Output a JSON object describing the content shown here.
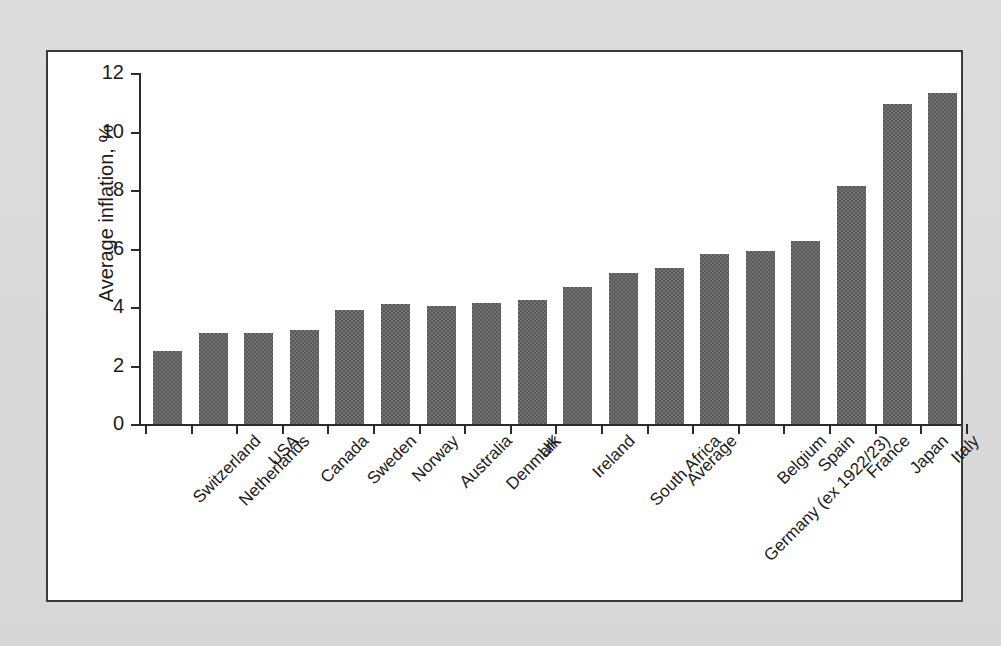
{
  "chart_data": {
    "type": "bar",
    "title": "",
    "subtitle": "",
    "xlabel": "",
    "ylabel": "Average inflation, %",
    "ylim": [
      0,
      12
    ],
    "ytick_labels": [
      "0",
      "2",
      "4",
      "6",
      "8",
      "10",
      "12"
    ],
    "ytick_values": [
      0,
      2,
      4,
      6,
      8,
      10,
      12
    ],
    "grid": false,
    "legend": null,
    "bar_color": "#585858",
    "background_color": "#ffffff",
    "axis_color": "#2b2b2b",
    "categories": [
      "Switzerland",
      "Netherlands",
      "USA",
      "Canada",
      "Sweden",
      "Norway",
      "Australia",
      "Denmark",
      "UK",
      "Ireland",
      "South Africa",
      "Average",
      "Germany (ex 1922/23)",
      "Belgium",
      "Spain",
      "France",
      "Japan",
      "Italy"
    ],
    "values": [
      2.5,
      3.1,
      3.1,
      3.2,
      3.9,
      4.1,
      4.05,
      4.15,
      4.25,
      4.7,
      5.15,
      5.35,
      5.8,
      5.9,
      6.25,
      8.15,
      10.95,
      11.3
    ]
  }
}
